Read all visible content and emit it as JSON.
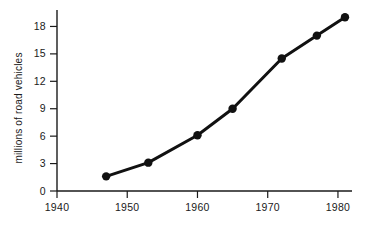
{
  "chart_data": {
    "type": "line",
    "title": "",
    "xlabel": "",
    "ylabel": "millions of road vehicles",
    "xlim": [
      1940,
      1982
    ],
    "ylim": [
      0,
      19.8
    ],
    "grid": false,
    "legend": null,
    "x_ticks": [
      1940,
      1950,
      1960,
      1970,
      1980
    ],
    "x_tick_labels": [
      "1940",
      "1950",
      "1960",
      "1970",
      "1980"
    ],
    "y_ticks": [
      0,
      3,
      6,
      9,
      12,
      15,
      18
    ],
    "y_tick_labels": [
      "0",
      "3",
      "6",
      "9",
      "12",
      "15",
      "18"
    ],
    "series": [
      {
        "name": "road vehicles",
        "color": "#111111",
        "marker": "circle",
        "x": [
          1947,
          1953,
          1960,
          1965,
          1972,
          1977,
          1981
        ],
        "values": [
          1.6,
          3.1,
          6.1,
          9.0,
          14.5,
          17.0,
          19.0
        ]
      }
    ]
  }
}
